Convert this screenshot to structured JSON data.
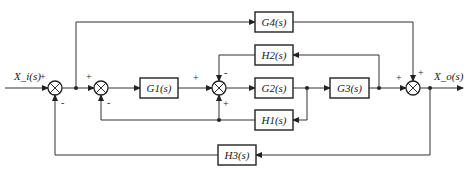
{
  "diagram": {
    "type": "control-system-block-diagram",
    "input_label": "X_i(s)",
    "output_label": "X_o(s)",
    "blocks": {
      "g1": "G1(s)",
      "g2": "G2(s)",
      "g3": "G3(s)",
      "g4": "G4(s)",
      "h1": "H1(s)",
      "h2": "H2(s)",
      "h3": "H3(s)"
    },
    "summing_junctions": [
      {
        "id": "sum1",
        "inputs": [
          {
            "from": "X_i(s)",
            "sign": "+"
          },
          {
            "from": "H3(s)",
            "sign": "-"
          }
        ]
      },
      {
        "id": "sum2",
        "inputs": [
          {
            "from": "sum1",
            "sign": "+"
          },
          {
            "from": "H1(s)",
            "sign": "-"
          }
        ]
      },
      {
        "id": "sum3",
        "inputs": [
          {
            "from": "G1(s)",
            "sign": "+"
          },
          {
            "from": "H2(s)",
            "sign": "-"
          },
          {
            "from": "H1(s)",
            "sign": "+"
          }
        ]
      },
      {
        "id": "sum4",
        "inputs": [
          {
            "from": "G3(s)",
            "sign": "+"
          },
          {
            "from": "G4(s)",
            "sign": "+"
          }
        ]
      }
    ],
    "signs": {
      "sum1_in": "+",
      "sum1_fb": "-",
      "sum2_in": "+",
      "sum2_fb": "-",
      "sum3_in": "+",
      "sum3_top": "-",
      "sum3_bottom": "+",
      "sum4_in": "+",
      "sum4_top": "+"
    }
  }
}
